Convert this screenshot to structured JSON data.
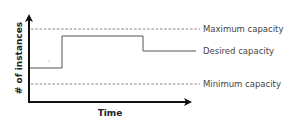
{
  "diagram": {
    "type": "step-line capacity diagram",
    "x_axis_label": "Time",
    "y_axis_label": "# of instances",
    "lines": {
      "maximum": {
        "label": "Maximum capacity",
        "style": "dashed",
        "y": 29
      },
      "desired": {
        "label": "Desired capacity",
        "style": "solid-step"
      },
      "minimum": {
        "label": "Minimum capacity",
        "style": "dashed",
        "y": 84
      }
    },
    "desired_steps": [
      {
        "x_start": 30,
        "x_end": 62,
        "y": 68
      },
      {
        "x_start": 62,
        "x_end": 143,
        "y": 36
      },
      {
        "x_start": 143,
        "x_end": 196,
        "y": 51
      }
    ],
    "colors": {
      "axis": "#111111",
      "dashed": "#777777",
      "desired": "#555555",
      "text": "#444444"
    }
  }
}
